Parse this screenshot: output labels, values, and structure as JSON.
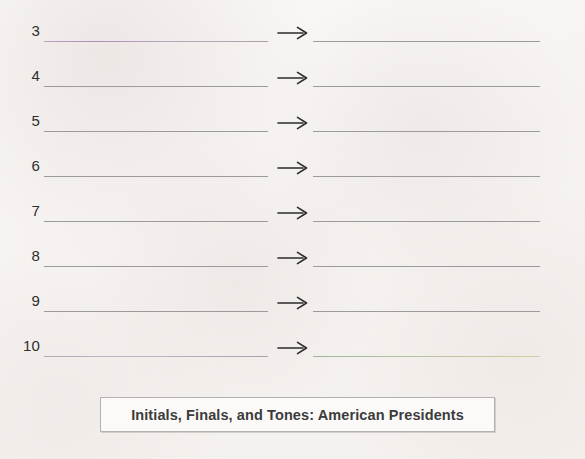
{
  "worksheet": {
    "caption": "Initials, Finals, and Tones: American Presidents",
    "arrow_glyph": "⟶",
    "arrow_icon_name": "right-arrow-icon",
    "colors": {
      "page_background": "#f8f5f3",
      "rule_line": "#9b9b9b",
      "number_text": "#2e2e2e",
      "caption_text": "#3c3c3c",
      "caption_border": "#b5b2ae",
      "caption_background": "#fbfaf9",
      "tint_row3_left": "#a98fb8",
      "tint_row10_left": "#b3aab4",
      "tint_row10_right": "#9fb79d"
    },
    "rows": [
      {
        "number": "3",
        "left_answer": "",
        "right_answer": ""
      },
      {
        "number": "4",
        "left_answer": "",
        "right_answer": ""
      },
      {
        "number": "5",
        "left_answer": "",
        "right_answer": ""
      },
      {
        "number": "6",
        "left_answer": "",
        "right_answer": ""
      },
      {
        "number": "7",
        "left_answer": "",
        "right_answer": ""
      },
      {
        "number": "8",
        "left_answer": "",
        "right_answer": ""
      },
      {
        "number": "9",
        "left_answer": "",
        "right_answer": ""
      },
      {
        "number": "10",
        "left_answer": "",
        "right_answer": ""
      }
    ]
  }
}
